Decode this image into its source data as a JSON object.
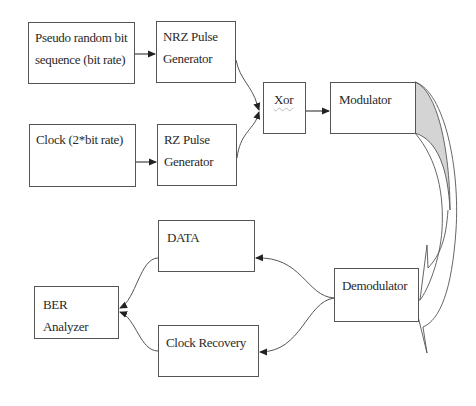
{
  "diagram": {
    "type": "block-diagram",
    "blocks": {
      "prbs": {
        "line1": "Pseudo random bit",
        "line2": "sequence (bit rate)"
      },
      "nrz": {
        "line1": "NRZ Pulse",
        "line2": "Generator"
      },
      "clock": {
        "line1": "Clock (2*bit rate)"
      },
      "rz": {
        "line1": "RZ Pulse",
        "line2": "Generator"
      },
      "xor": {
        "label": "Xor"
      },
      "modulator": {
        "label": "Modulator"
      },
      "data": {
        "label": "DATA"
      },
      "demodulator": {
        "label": "Demodulator"
      },
      "ber": {
        "label": "BER Analyzer"
      },
      "clock_recovery": {
        "label": "Clock Recovery"
      }
    },
    "connections": [
      {
        "from": "Pseudo random bit sequence (bit rate)",
        "to": "NRZ Pulse Generator"
      },
      {
        "from": "Clock (2*bit rate)",
        "to": "RZ Pulse Generator"
      },
      {
        "from": "NRZ Pulse Generator",
        "to": "Xor"
      },
      {
        "from": "RZ Pulse Generator",
        "to": "Xor"
      },
      {
        "from": "Xor",
        "to": "Modulator"
      },
      {
        "from": "Modulator",
        "to": "Demodulator",
        "style": "curved-block-arrow"
      },
      {
        "from": "Demodulator",
        "to": "DATA"
      },
      {
        "from": "Demodulator",
        "to": "Clock Recovery"
      },
      {
        "from": "DATA",
        "to": "BER Analyzer"
      },
      {
        "from": "Clock Recovery",
        "to": "BER Analyzer"
      }
    ],
    "colors": {
      "line": "#555555",
      "fill_shaded": "#d4d4d4",
      "background": "#ffffff"
    }
  }
}
